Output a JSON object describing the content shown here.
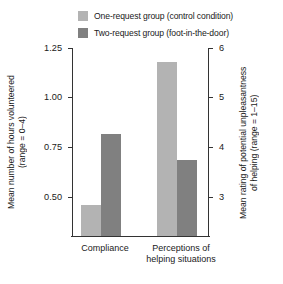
{
  "legend": {
    "items": [
      {
        "label": "One-request group (control condition)",
        "color": "#b3b3b3",
        "swatch_name": "legend-swatch-light"
      },
      {
        "label": "Two-request group (foot-in-the-door)",
        "color": "#808080",
        "swatch_name": "legend-swatch-dark"
      }
    ]
  },
  "axes": {
    "left": {
      "title_line1": "Mean number of hours volunteered",
      "title_line2": "(range = 0–4)",
      "ticks": [
        "0.50",
        "0.75",
        "1.00",
        "1.25"
      ]
    },
    "right": {
      "title_line1": "Mean rating of potential unpleasantness",
      "title_line2": "of helping (range = 1–15)",
      "ticks": [
        "3",
        "4",
        "5",
        "6"
      ]
    }
  },
  "categories": [
    {
      "label": "Compliance"
    },
    {
      "label": "Perceptions of helping situations"
    }
  ],
  "chart_data": {
    "type": "bar",
    "title": "",
    "xlabel": "",
    "ylabel": "Mean number of hours volunteered (range = 0–4)",
    "y2label": "Mean rating of potential unpleasantness of helping (range = 1–15)",
    "categories": [
      "Compliance",
      "Perceptions of helping situations"
    ],
    "series": [
      {
        "name": "One-request group (control condition)",
        "color": "#b3b3b3",
        "values": [
          0.53,
          1.24
        ],
        "axis": [
          "left",
          "right"
        ],
        "values_right_axis": [
          null,
          5.95
        ]
      },
      {
        "name": "Two-request group (foot-in-the-door)",
        "color": "#808080",
        "values": [
          0.88,
          0.75
        ],
        "axis": [
          "left",
          "right"
        ],
        "values_right_axis": [
          null,
          4.0
        ]
      }
    ],
    "ylim": [
      0.375,
      1.3125
    ],
    "yticks": [
      0.5,
      0.75,
      1.0,
      1.25
    ],
    "y2lim": [
      2.5,
      6.25
    ],
    "y2ticks": [
      3,
      4,
      5,
      6
    ],
    "grid": false,
    "legend_position": "top"
  }
}
